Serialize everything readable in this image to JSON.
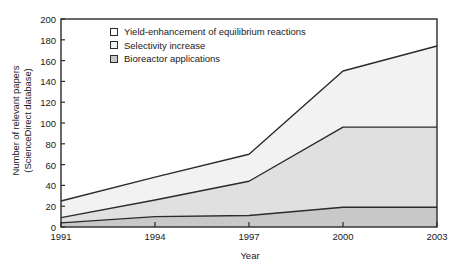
{
  "chart_data": {
    "type": "area",
    "stacked": true,
    "title": "",
    "xlabel": "Year",
    "ylabel": "Number of relevant papers\n(ScienceDirect database)",
    "ylabel_line1": "Number of relevant papers",
    "ylabel_line2": "(ScienceDirect database)",
    "x": [
      1991,
      1994,
      1997,
      2000,
      2003
    ],
    "xtick_labels": [
      "1991",
      "1994",
      "1997",
      "2000",
      "2003"
    ],
    "ytick_labels": [
      "0",
      "20",
      "40",
      "60",
      "80",
      "100",
      "120",
      "140",
      "160",
      "180",
      "200"
    ],
    "ytick_values": [
      0,
      20,
      40,
      60,
      80,
      100,
      120,
      140,
      160,
      180,
      200
    ],
    "xlim": [
      1991,
      2003
    ],
    "ylim": [
      0,
      200
    ],
    "grid": false,
    "legend_position": "upper-left-inside",
    "series": [
      {
        "name": "Yield-enhancement of equilibrium reactions",
        "values": [
          25,
          48,
          70,
          150,
          174
        ],
        "fill": "#f2f2f2",
        "swatch": "#ffffff"
      },
      {
        "name": "Selectivity increase",
        "values": [
          9,
          26,
          44,
          96,
          96
        ],
        "fill": "#e0e0e0",
        "swatch": "#f2f2f2"
      },
      {
        "name": "Bioreactor applications",
        "values": [
          4,
          10,
          11,
          19,
          19
        ],
        "fill": "#c8c8c8",
        "swatch": "#c8c8c8"
      }
    ],
    "colors": {
      "axis": "#2b2b2b",
      "line": "#2b2b2b",
      "background": "#ffffff"
    }
  }
}
